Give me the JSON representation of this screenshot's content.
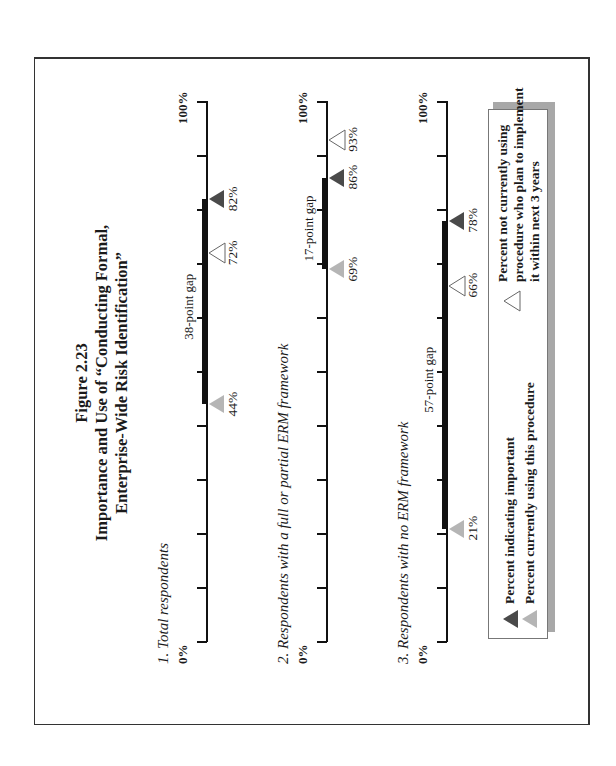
{
  "figure": {
    "number": "Figure 2.23",
    "title_line1": "Importance and Use of “Conducting Formal,",
    "title_line2": "Enterprise-Wide Risk Identification”"
  },
  "axis": {
    "min_label": "0%",
    "max_label": "100%"
  },
  "legend": {
    "important": "Percent indicating important",
    "using": "Percent currently using this procedure",
    "plan_line1": "Percent not currently using",
    "plan_line2": "procedure who plan to implement",
    "plan_line3": "it within next 3 years"
  },
  "colors": {
    "important": "#4a4a4a",
    "using": "#b5b5b5",
    "plan": "#ffffff",
    "axis": "#111111"
  },
  "charts": [
    {
      "label": "1.  Total respondents",
      "gap_label": "38-point gap",
      "important": "82%",
      "using": "44%",
      "plan": "72%"
    },
    {
      "label": "2.  Respondents with a full or partial ERM framework",
      "gap_label": "17-point gap",
      "important": "86%",
      "using": "69%",
      "plan": "93%"
    },
    {
      "label": "3.  Respondents with no ERM framework",
      "gap_label": "57-point gap",
      "important": "78%",
      "using": "21%",
      "plan": "66%"
    }
  ],
  "chart_data": {
    "type": "scatter",
    "title": "Figure 2.23 Importance and Use of “Conducting Formal, Enterprise-Wide Risk Identification”",
    "categories": [
      "Total respondents",
      "Respondents with a full or partial ERM framework",
      "Respondents with no ERM framework"
    ],
    "series": [
      {
        "name": "Percent indicating important",
        "marker": "dark triangle",
        "values": [
          82,
          86,
          78
        ]
      },
      {
        "name": "Percent currently using this procedure",
        "marker": "light gray triangle",
        "values": [
          44,
          69,
          21
        ]
      },
      {
        "name": "Percent not currently using procedure who plan to implement it within next 3 years",
        "marker": "open triangle",
        "values": [
          72,
          93,
          66
        ]
      }
    ],
    "gaps": [
      38,
      17,
      57
    ],
    "gap_labels": [
      "38-point gap",
      "17-point gap",
      "57-point gap"
    ],
    "xlabel": "",
    "ylabel": "",
    "xlim": [
      0,
      100
    ],
    "tick_interval": 10,
    "tick_labels_shown": [
      "0%",
      "100%"
    ],
    "grid": false,
    "legend_position": "bottom",
    "orientation": "page rotated 90 degrees counter-clockwise"
  }
}
